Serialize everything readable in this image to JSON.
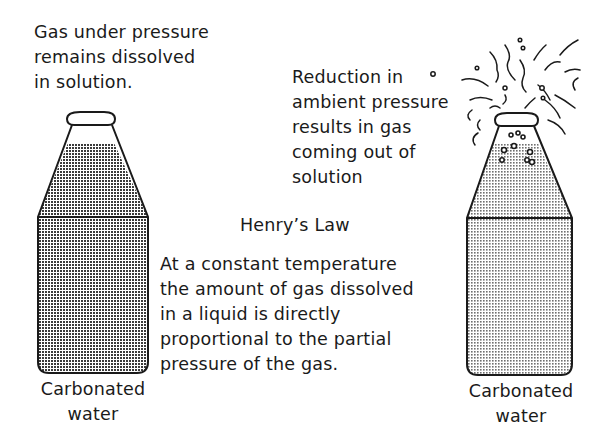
{
  "left_caption": {
    "lines": [
      "Gas under pressure",
      "remains dissolved",
      "in solution."
    ]
  },
  "right_caption": {
    "lines": [
      "Reduction in",
      "ambient pressure",
      "results in gas",
      "coming out of",
      "solution"
    ]
  },
  "law": {
    "title": "Henry’s Law",
    "lines": [
      "At a constant temperature",
      "the amount of gas dissolved",
      "in a liquid is directly",
      "proportional to the partial",
      "pressure of the gas."
    ]
  },
  "left_bottle": {
    "label_lines": [
      "Carbonated",
      "water"
    ],
    "state": "sealed",
    "fill_color": "#555555"
  },
  "right_bottle": {
    "label_lines": [
      "Carbonated",
      "water"
    ],
    "state": "opened",
    "fill_color": "#9a9a9a"
  }
}
